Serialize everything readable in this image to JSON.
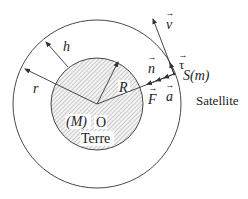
{
  "diagram": {
    "colors": {
      "stroke": "#333333",
      "hatch": "#8a8a8a",
      "earth_fill": "#e6e6e6",
      "background": "#ffffff"
    },
    "geometry": {
      "center": [
        97,
        104
      ],
      "earth_radius": 46,
      "orbit_radius": 84,
      "satellite": [
        174,
        74
      ]
    },
    "labels": {
      "h": "h",
      "r": "r",
      "R": "R",
      "mass_earth": "(M)",
      "center": "O",
      "earth_name": "Terre",
      "v": "v",
      "tau": "τ",
      "n": "n",
      "satellite_point": "S(m)",
      "F": "F",
      "a": "a",
      "satellite_name": "Satellite",
      "vector_arrow": "→"
    }
  }
}
